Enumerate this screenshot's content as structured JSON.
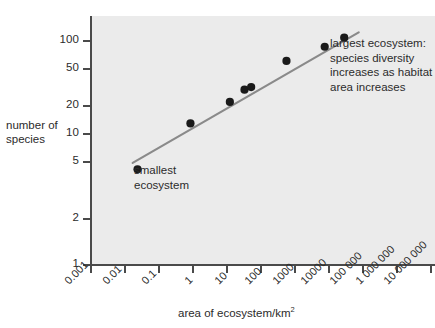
{
  "chart_data": {
    "type": "scatter",
    "title": "",
    "subtitle": "",
    "xlabel": "area of ecosystem/km",
    "xlabel_superscript": "2",
    "ylabel_line1": "number of",
    "ylabel_line2": "species",
    "x_scale": "log",
    "y_scale": "log",
    "xlim": [
      0.001,
      10000000
    ],
    "ylim": [
      1,
      130
    ],
    "grid": false,
    "legend": "none",
    "x_ticks": [
      "0.001",
      "0.01",
      "0.1",
      "1",
      "10",
      "100",
      "1000",
      "10000",
      "100 000",
      "1 000 000",
      "10 000 000"
    ],
    "x_tick_values": [
      0.001,
      0.01,
      0.1,
      1,
      10,
      100,
      1000,
      10000,
      100000,
      1000000,
      10000000
    ],
    "y_ticks": [
      "100",
      "50",
      "20",
      "10",
      "5",
      "2",
      "1"
    ],
    "y_tick_values": [
      100,
      50,
      20,
      10,
      5,
      2,
      1
    ],
    "points": [
      {
        "x": 0.025,
        "y": 7
      },
      {
        "x": 0.9,
        "y": 18
      },
      {
        "x": 13,
        "y": 28
      },
      {
        "x": 35,
        "y": 36
      },
      {
        "x": 55,
        "y": 38
      },
      {
        "x": 600,
        "y": 65
      },
      {
        "x": 8000,
        "y": 87
      },
      {
        "x": 30000,
        "y": 105
      }
    ],
    "trend_line": {
      "x_start": 0.018,
      "y_start": 8.0,
      "x_end": 80000,
      "y_end": 117
    },
    "annotations": [
      {
        "name": "largest-ecosystem",
        "text": "largest ecosystem: species diversity increases as habitat area increases"
      },
      {
        "name": "smallest-ecosystem",
        "text": "smallest ecosystem"
      }
    ]
  },
  "colors": {
    "plot_background": "#ebebeb",
    "page_background": "#ffffff",
    "axis": "#4a4a4a",
    "trend_line": "#8a8a8a",
    "point": "#1a1a1a",
    "text": "#2b2b2b"
  }
}
